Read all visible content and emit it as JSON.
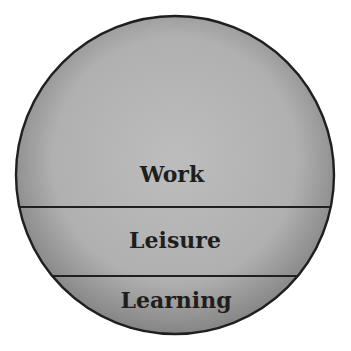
{
  "diagram": {
    "type": "segmented-circle",
    "colors": {
      "fill_center": "#bdbdbd",
      "fill_mid": "#b0b0b0",
      "fill_edge": "#858585",
      "stroke": "#1f1f1f",
      "text": "#1e1e1e",
      "background": "#ffffff"
    },
    "sections": [
      {
        "id": "work",
        "label": "Work"
      },
      {
        "id": "leisure",
        "label": "Leisure"
      },
      {
        "id": "learning",
        "label": "Learning"
      }
    ]
  }
}
